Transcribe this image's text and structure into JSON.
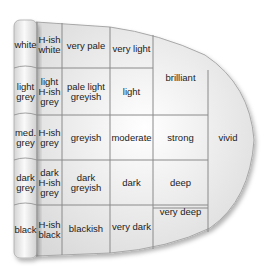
{
  "diagram": {
    "neutral_column": [
      "white",
      "light grey",
      "med. grey",
      "dark grey",
      "black"
    ],
    "hueish_column": [
      "H-ish white",
      "light H-ish grey",
      "H-ish grey",
      "dark H-ish grey",
      "H-ish black"
    ],
    "cells": {
      "very_pale": "very pale",
      "pale_light_greyish": "pale light greyish",
      "greyish": "greyish",
      "dark_greyish": "dark greyish",
      "blackish": "blackish",
      "very_light": "very light",
      "light": "light",
      "moderate": "moderate",
      "dark": "dark",
      "very_dark": "very dark",
      "brilliant": "brilliant",
      "strong": "strong",
      "deep": "deep",
      "very_deep": "very deep",
      "vivid": "vivid"
    },
    "colors": {
      "grid_line": "#8a8a8a",
      "cell_fill": "#e8e8e8",
      "outline": "#9a9a9a"
    }
  }
}
